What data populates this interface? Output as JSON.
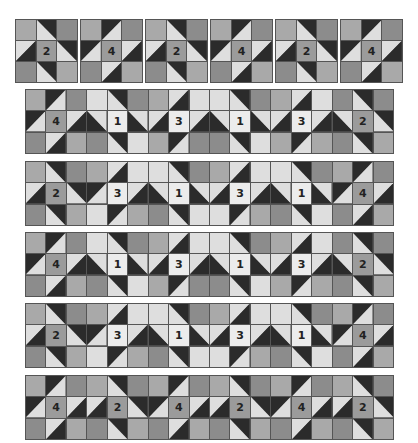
{
  "colors": {
    "D": "#2b2b2b",
    "M": "#8c8c8c",
    "G": "#a9a9a9",
    "L": "#dedede",
    "C": "#9b9b9b",
    "W": "#ececec"
  },
  "top_blocks": [
    {
      "label": "2",
      "x": 15,
      "y": 19,
      "cells": [
        [
          "G",
          "\\:D/L",
          "M"
        ],
        [
          "/:L/D",
          "C",
          "\\:D/L"
        ],
        [
          "M",
          "\\:D/L",
          "G"
        ]
      ]
    },
    {
      "label": "4",
      "x": 80,
      "y": 19,
      "cells": [
        [
          "G",
          "/:D/L",
          "M"
        ],
        [
          "/:D/L",
          "C",
          "/:L/D"
        ],
        [
          "M",
          "/:L/D",
          "G"
        ]
      ]
    },
    {
      "label": "2",
      "x": 145,
      "y": 19,
      "cells": [
        [
          "G",
          "\\:D/L",
          "M"
        ],
        [
          "/:L/D",
          "C",
          "\\:D/L"
        ],
        [
          "M",
          "\\:D/L",
          "G"
        ]
      ]
    },
    {
      "label": "4",
      "x": 210,
      "y": 19,
      "cells": [
        [
          "G",
          "/:D/L",
          "M"
        ],
        [
          "/:D/L",
          "C",
          "/:L/D"
        ],
        [
          "M",
          "/:L/D",
          "G"
        ]
      ]
    },
    {
      "label": "2",
      "x": 275,
      "y": 19,
      "cells": [
        [
          "G",
          "\\:D/L",
          "M"
        ],
        [
          "/:L/D",
          "C",
          "\\:D/L"
        ],
        [
          "M",
          "\\:D/L",
          "G"
        ]
      ]
    },
    {
      "label": "4",
      "x": 340,
      "y": 19,
      "cells": [
        [
          "G",
          "/:D/L",
          "M"
        ],
        [
          "/:D/L",
          "C",
          "/:L/D"
        ],
        [
          "M",
          "/:L/D",
          "G"
        ]
      ]
    }
  ],
  "strips": [
    {
      "name": "row-1",
      "y": 89,
      "labels": [
        "4",
        "1",
        "3",
        "1",
        "3",
        "2"
      ],
      "cells": [
        [
          "G",
          "/:D/L",
          "M",
          "L",
          "\\:D/L",
          "M",
          "G",
          "/:L/D",
          "L",
          "L",
          "\\:D/L",
          "M",
          "G",
          "/:L/D",
          "L",
          "M",
          "\\:D/L",
          "M"
        ],
        [
          "/:D/L",
          "C",
          "/:L/D",
          "\\:L/D",
          "W",
          "\\:L/D",
          "/:L/D",
          "W",
          "/:L/D",
          "\\:L/D",
          "W",
          "\\:L/D",
          "/:L/D",
          "W",
          "/:L/D",
          "\\:L/D",
          "C",
          "\\:D/L"
        ],
        [
          "M",
          "/:L/D",
          "G",
          "M",
          "\\:D/L",
          "L",
          "G",
          "/:D/L",
          "M",
          "M",
          "\\:D/L",
          "L",
          "G",
          "/:D/L",
          "G",
          "M",
          "\\:D/L",
          "G"
        ]
      ]
    },
    {
      "name": "row-2",
      "y": 161,
      "labels": [
        "2",
        "3",
        "1",
        "3",
        "1",
        "4"
      ],
      "cells": [
        [
          "G",
          "\\:D/L",
          "M",
          "G",
          "/:L/D",
          "L",
          "L",
          "\\:D/L",
          "M",
          "G",
          "/:L/D",
          "L",
          "L",
          "\\:D/L",
          "M",
          "G",
          "/:D/L",
          "M"
        ],
        [
          "/:L/D",
          "C",
          "\\:D/L",
          "/:D/L",
          "W",
          "/:L/D",
          "\\:L/D",
          "W",
          "\\:L/D",
          "/:L/D",
          "W",
          "/:L/D",
          "\\:L/D",
          "W",
          "\\:L/D",
          "/:D/L",
          "C",
          "/:L/D"
        ],
        [
          "M",
          "\\:D/L",
          "G",
          "L",
          "/:D/L",
          "G",
          "M",
          "\\:D/L",
          "L",
          "L",
          "/:D/L",
          "G",
          "M",
          "\\:D/L",
          "L",
          "M",
          "/:L/D",
          "G"
        ]
      ]
    },
    {
      "name": "row-3",
      "y": 232,
      "labels": [
        "4",
        "1",
        "3",
        "1",
        "3",
        "2"
      ],
      "cells": [
        [
          "G",
          "/:D/L",
          "M",
          "L",
          "\\:D/L",
          "M",
          "G",
          "/:L/D",
          "L",
          "L",
          "\\:D/L",
          "M",
          "G",
          "/:L/D",
          "L",
          "M",
          "\\:D/L",
          "M"
        ],
        [
          "/:D/L",
          "C",
          "/:L/D",
          "\\:L/D",
          "W",
          "\\:L/D",
          "/:L/D",
          "W",
          "/:L/D",
          "\\:L/D",
          "W",
          "\\:L/D",
          "/:L/D",
          "W",
          "/:L/D",
          "\\:L/D",
          "C",
          "\\:D/L"
        ],
        [
          "M",
          "/:L/D",
          "G",
          "M",
          "\\:D/L",
          "L",
          "G",
          "/:D/L",
          "M",
          "M",
          "\\:D/L",
          "L",
          "G",
          "/:D/L",
          "G",
          "M",
          "\\:D/L",
          "G"
        ]
      ]
    },
    {
      "name": "row-4",
      "y": 303,
      "labels": [
        "2",
        "3",
        "1",
        "3",
        "1",
        "4"
      ],
      "cells": [
        [
          "G",
          "\\:D/L",
          "M",
          "G",
          "/:L/D",
          "L",
          "L",
          "\\:D/L",
          "M",
          "G",
          "/:L/D",
          "L",
          "L",
          "\\:D/L",
          "M",
          "G",
          "/:D/L",
          "M"
        ],
        [
          "/:L/D",
          "C",
          "\\:D/L",
          "/:D/L",
          "W",
          "/:L/D",
          "\\:L/D",
          "W",
          "\\:L/D",
          "/:L/D",
          "W",
          "/:L/D",
          "\\:L/D",
          "W",
          "\\:L/D",
          "/:D/L",
          "C",
          "/:L/D"
        ],
        [
          "M",
          "\\:D/L",
          "G",
          "L",
          "/:D/L",
          "G",
          "M",
          "\\:D/L",
          "L",
          "L",
          "/:D/L",
          "G",
          "M",
          "\\:D/L",
          "L",
          "M",
          "/:L/D",
          "G"
        ]
      ]
    },
    {
      "name": "row-5",
      "y": 375,
      "labels": [
        "4",
        "2",
        "4",
        "2",
        "4",
        "2"
      ],
      "cells": [
        [
          "G",
          "/:D/L",
          "M",
          "G",
          "\\:D/L",
          "M",
          "G",
          "/:D/L",
          "M",
          "G",
          "\\:D/L",
          "M",
          "G",
          "/:D/L",
          "M",
          "G",
          "\\:D/L",
          "M"
        ],
        [
          "/:D/L",
          "C",
          "/:L/D",
          "/:L/D",
          "C",
          "\\:D/L",
          "/:D/L",
          "C",
          "/:L/D",
          "/:L/D",
          "C",
          "\\:D/L",
          "/:D/L",
          "C",
          "/:L/D",
          "/:L/D",
          "C",
          "\\:D/L"
        ],
        [
          "M",
          "/:L/D",
          "G",
          "M",
          "\\:D/L",
          "G",
          "M",
          "/:L/D",
          "G",
          "M",
          "\\:D/L",
          "G",
          "M",
          "/:L/D",
          "G",
          "M",
          "\\:D/L",
          "G"
        ]
      ]
    }
  ],
  "label_positions": {
    "top_center_cell": [
      1,
      1
    ],
    "strip_center_cols": [
      1,
      4,
      7,
      10,
      13,
      16
    ]
  }
}
